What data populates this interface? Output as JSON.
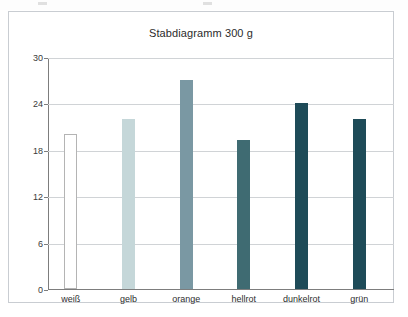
{
  "chart": {
    "title": "Stabdiagramm 300 g",
    "background": "#ffffff",
    "frame_color": "#c9cdd2",
    "grid_color": "#d0d3d6",
    "axis_color": "#7d7d7d"
  },
  "chart_data": {
    "type": "bar",
    "title": "Stabdiagramm 300 g",
    "xlabel": "",
    "ylabel": "",
    "ylim": [
      0,
      30
    ],
    "yticks": [
      0,
      6,
      12,
      18,
      24,
      30
    ],
    "grid": true,
    "legend": "none",
    "categories": [
      "weiß",
      "gelb",
      "orange",
      "hellrot",
      "dunkelrot",
      "grün"
    ],
    "values": [
      20,
      22,
      27,
      19.3,
      24,
      22
    ],
    "bar_colors": [
      "#ffffff",
      "#c5d7d9",
      "#7a98a3",
      "#3f6b72",
      "#1e4b58",
      "#1e4b58"
    ],
    "bar_border_colors": [
      "#b4b4b4",
      "none",
      "none",
      "none",
      "none",
      "none"
    ]
  },
  "y_tick_labels": [
    "0",
    "6",
    "12",
    "18",
    "24",
    "30"
  ]
}
